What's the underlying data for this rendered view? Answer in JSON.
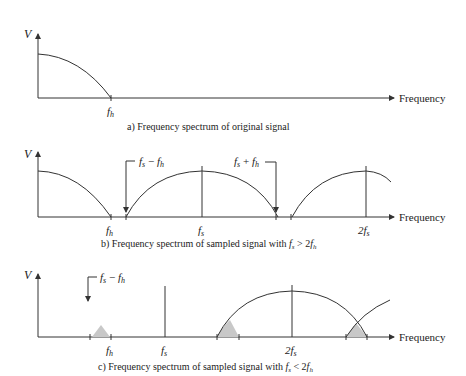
{
  "panels": [
    {
      "id": "a",
      "y_label": "V",
      "x_axis_label": "Frequency",
      "ticks": [
        {
          "label": "f",
          "sub": "h"
        }
      ],
      "caption": "a) Frequency spectrum of original signal"
    },
    {
      "id": "b",
      "y_label": "V",
      "x_axis_label": "Frequency",
      "ticks": [
        {
          "label": "f",
          "sub": "h"
        },
        {
          "label": "f",
          "sub": "s"
        },
        {
          "label": "2f",
          "sub": "s"
        }
      ],
      "annotations": [
        {
          "text_a": "f",
          "sub_a": "s",
          "op": " − ",
          "text_b": "f",
          "sub_b": "h"
        },
        {
          "text_a": "f",
          "sub_a": "s",
          "op": " + ",
          "text_b": "f",
          "sub_b": "h"
        }
      ],
      "caption_prefix": "b) Frequency spectrum of sampled signal with ",
      "caption_math": {
        "a": "f",
        "a_sub": "s",
        "op": " > 2",
        "b": "f",
        "b_sub": "h"
      }
    },
    {
      "id": "c",
      "y_label": "V",
      "x_axis_label": "Frequency",
      "ticks": [
        {
          "label": "f",
          "sub": "h"
        },
        {
          "label": "f",
          "sub": "s"
        },
        {
          "label": "2f",
          "sub": "s"
        }
      ],
      "annotations": [
        {
          "text_a": "f",
          "sub_a": "s",
          "op": " − ",
          "text_b": "f",
          "sub_b": "h"
        }
      ],
      "caption_prefix": "c) Frequency spectrum of sampled signal with ",
      "caption_math": {
        "a": "f",
        "a_sub": "s",
        "op": " < 2",
        "b": "f",
        "b_sub": "h"
      }
    }
  ],
  "colors": {
    "line": "#333333",
    "shade": "#c8c8c8"
  }
}
